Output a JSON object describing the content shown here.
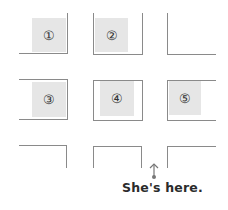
{
  "diagram": {
    "type": "street-map-grid",
    "blocks": [
      {
        "id": 1,
        "label": "①",
        "row": 1,
        "col": 1,
        "shaded": true
      },
      {
        "id": 2,
        "label": "②",
        "row": 1,
        "col": 2,
        "shaded": true
      },
      {
        "id": null,
        "label": "",
        "row": 1,
        "col": 3,
        "shaded": false
      },
      {
        "id": 3,
        "label": "③",
        "row": 2,
        "col": 1,
        "shaded": true
      },
      {
        "id": 4,
        "label": "④",
        "row": 2,
        "col": 2,
        "shaded": true
      },
      {
        "id": 5,
        "label": "⑤",
        "row": 2,
        "col": 3,
        "shaded": true
      },
      {
        "id": null,
        "label": "",
        "row": 3,
        "col": 1,
        "shaded": false
      },
      {
        "id": null,
        "label": "",
        "row": 3,
        "col": 2,
        "shaded": false
      },
      {
        "id": null,
        "label": "",
        "row": 3,
        "col": 3,
        "shaded": false
      }
    ],
    "marker": {
      "icon": "up-arrow-icon",
      "caption": "She's here."
    }
  },
  "labels": {
    "b1": "①",
    "b2": "②",
    "b3": "③",
    "b4": "④",
    "b5": "⑤",
    "caption": "She's here."
  },
  "colors": {
    "line": "#8a8a8a",
    "shade": "#e6e6e6",
    "text": "#2b2b2b"
  }
}
